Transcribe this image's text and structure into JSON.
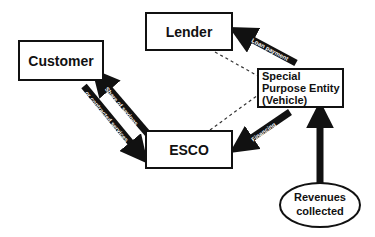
{
  "diagram": {
    "nodes": {
      "customer": "Customer",
      "lender": "Lender",
      "spe_line1": "Special",
      "spe_line2": "Purpose Entity",
      "spe_line3": "(Vehicle)",
      "esco": "ESCO",
      "revenues_line1": "Revenues",
      "revenues_line2": "collected"
    },
    "arrows": {
      "esco_to_customer": "or contracted services",
      "customer_from_esco": "Share of savings",
      "spe_to_lender": "Loan payment",
      "spe_to_esco": "Financing"
    },
    "colors": {
      "ink": "#111111",
      "background": "#ffffff"
    }
  }
}
